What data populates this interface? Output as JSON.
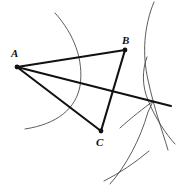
{
  "figure": {
    "background_color": "#ffffff",
    "line_color": "#111111",
    "arc_color": "#4a4a4a",
    "width": 176,
    "height": 185
  },
  "vertices": [
    {
      "id": "A",
      "label": "A",
      "x": 17,
      "y": 67,
      "label_x": 11,
      "label_y": 57
    },
    {
      "id": "B",
      "label": "B",
      "x": 125,
      "y": 50,
      "label_x": 122,
      "label_y": 44
    },
    {
      "id": "C",
      "label": "C",
      "x": 101,
      "y": 131,
      "label_x": 96,
      "label_y": 146
    }
  ],
  "segments": [
    {
      "name": "segment-ab",
      "from": "A",
      "to": "B",
      "x1": 17,
      "y1": 67,
      "x2": 125,
      "y2": 50
    },
    {
      "name": "segment-bc",
      "from": "B",
      "to": "C",
      "x1": 125,
      "y1": 50,
      "x2": 101,
      "y2": 131
    },
    {
      "name": "segment-ac",
      "from": "A",
      "to": "C",
      "x1": 17,
      "y1": 67,
      "x2": 101,
      "y2": 131
    },
    {
      "name": "segment-a-ray",
      "from": "A",
      "to": "ray-end",
      "x1": 17,
      "y1": 67,
      "x2": 171,
      "y2": 106
    }
  ],
  "arcs": [
    {
      "name": "arc-left",
      "path": "M 55 13 C 74 34 84 60 80 86 C 76 108 58 124 25 129"
    },
    {
      "name": "arc-right-outer",
      "path": "M 154 2 C 144 26 142 54 148 80 C 154 108 162 130 168 150"
    },
    {
      "name": "arc-right-inner",
      "path": "M 147 57 C 142 70 142 86 148 100 C 155 118 166 134 175 144"
    },
    {
      "name": "arc-lower-right-long",
      "path": "M 110 184 C 126 166 140 140 148 112 C 152 104 153 101 153 101"
    },
    {
      "name": "arc-lower-right-short",
      "path": "M 120 128 C 132 117 144 108 152 102"
    },
    {
      "name": "arc-bottom",
      "path": "M 104 181 C 120 173 136 162 149 151"
    }
  ]
}
